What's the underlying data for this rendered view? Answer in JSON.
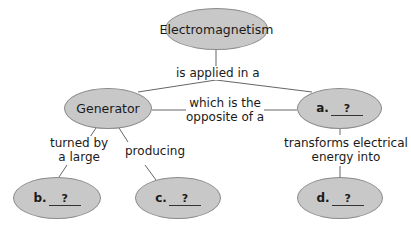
{
  "nodes": {
    "root": "Electromagnetism",
    "generator": "Generator",
    "a": {
      "letter": "a.",
      "answer": "?"
    },
    "b": {
      "letter": "b.",
      "answer": "?"
    },
    "c": {
      "letter": "c.",
      "answer": "?"
    },
    "d": {
      "letter": "d.",
      "answer": "?"
    }
  },
  "links": {
    "applied": "is applied in a",
    "opposite_1": "which is the",
    "opposite_2": "opposite of a",
    "turned_1": "turned by",
    "turned_2": "a large",
    "producing": "producing",
    "transforms_1": "transforms electrical",
    "transforms_2": "energy into"
  }
}
